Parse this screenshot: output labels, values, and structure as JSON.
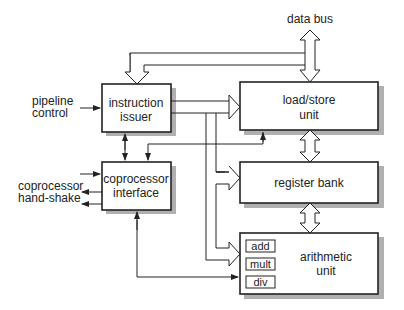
{
  "diagram": {
    "labels": {
      "data_bus": "data bus",
      "pipeline_control_1": "pipeline",
      "pipeline_control_2": "control",
      "coprocessor_handshake_1": "coprocessor",
      "coprocessor_handshake_2": "hand-shake"
    },
    "blocks": {
      "instruction_issuer": [
        "instruction",
        "issuer"
      ],
      "coprocessor_interface": [
        "coprocessor",
        "interface"
      ],
      "load_store_unit": [
        "load/store",
        "unit"
      ],
      "register_bank": [
        "register bank"
      ],
      "arithmetic_unit": [
        "arithmetic",
        "unit"
      ]
    },
    "arithmetic_subunits": [
      "add",
      "mult",
      "div"
    ],
    "colors": {
      "stroke": "#222222",
      "shadow": "#aaaaaa",
      "fill": "#ffffff"
    }
  }
}
